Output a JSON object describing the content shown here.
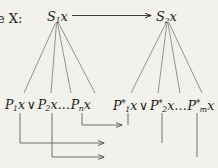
{
  "diagram": {
    "kind": "mathematical-derivation-diagram",
    "background_color": "#f2f1ec",
    "ink_color": "#1d1d1b",
    "line_color": "#6e6e6e",
    "labels": {
      "prefix": "e X:",
      "top_left": {
        "base": "S",
        "subscript": "1",
        "argument": "x"
      },
      "top_right": {
        "base": "S",
        "subscript": "2",
        "argument": "x"
      },
      "bottom_left_disjunction": {
        "term1_base": "P",
        "term1_sub": "1",
        "term1_arg": "x",
        "operator": "∨",
        "term2_base": "P",
        "term2_sub": "2",
        "term2_arg": "x",
        "ellipsis": "…",
        "term3_base": "P",
        "term3_sub": "n",
        "term3_arg": "x"
      },
      "bottom_right_disjunction": {
        "term1_base": "P",
        "term1_sub": "1",
        "term1_sup": "*",
        "term1_arg": "x",
        "operator": "∨",
        "term2_base": "P",
        "term2_sub": "2",
        "term2_sup": "*",
        "term2_arg": "x",
        "ellipsis": "…",
        "term3_base": "P",
        "term3_sub": "m",
        "term3_sup": "*",
        "term3_arg": "x"
      }
    },
    "connectors": {
      "top_arrow": {
        "from": "S1x",
        "to": "S2x",
        "direction": "right"
      },
      "left_fan": {
        "from": "S1x",
        "branches": 4,
        "to": "bottom_left_disjunction"
      },
      "right_fan": {
        "from": "S2x",
        "branches": 4,
        "to": "bottom_right_disjunction"
      },
      "bracket_arrows": [
        {
          "name": "inner",
          "from": "Pnx",
          "to": "P1*x",
          "direction": "right"
        },
        {
          "name": "middle",
          "from": "P1x",
          "to": "P2*x",
          "direction": "right"
        },
        {
          "name": "outer",
          "from": "P2x",
          "to": "Pm*x",
          "direction": "right"
        }
      ]
    }
  }
}
